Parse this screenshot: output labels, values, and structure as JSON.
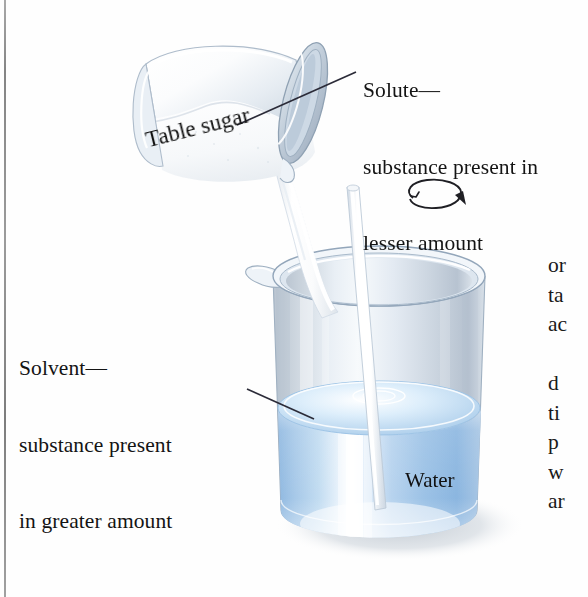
{
  "figure": {
    "scene": "Beaker of water with glass stirring rod while table sugar is poured in from a tilted cylindrical container",
    "background_color": "#ffffff"
  },
  "annotations": {
    "solute": {
      "line1": "Solute—",
      "line2": "substance present in",
      "line3": "lesser amount",
      "leader_from": "355,73",
      "leader_to": "237,125"
    },
    "solvent": {
      "line1": "Solvent—",
      "line2": "substance present",
      "line3": "in greater amount",
      "leader_from": "248,390",
      "leader_to": "314,419"
    }
  },
  "in_image_labels": {
    "table_sugar": "Table sugar",
    "water": "Water"
  },
  "body_text_fragments": {
    "block_a": "or\nta\nac",
    "block_b": "d\nti\np\nw\nar"
  },
  "colors": {
    "water_blue": "#a9c9e9",
    "water_deep_blue": "#7fb0dd",
    "glass_gray": "#c9d3de",
    "glass_light": "#eef3f8",
    "outline": "#8fa3b8",
    "text": "#141414",
    "leader_line": "#2b2b38",
    "shadow": "#c4ccd4",
    "rod_white": "#ffffff",
    "sugar_white": "#f7f8fa"
  },
  "icons": {
    "rotation_arrow": "circular-arrow-icon",
    "page_rule": "column-rule"
  }
}
